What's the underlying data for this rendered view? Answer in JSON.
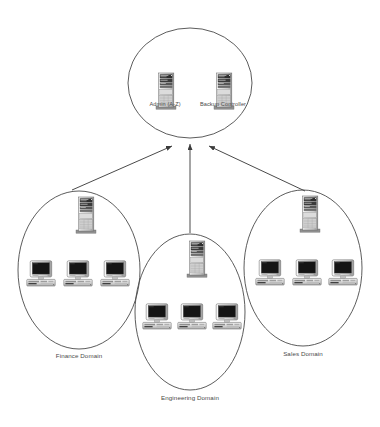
{
  "diagram": {
    "type": "network-topology",
    "background_color": "#ffffff",
    "line_color": "#4a4a4a",
    "width": 380,
    "height": 427
  },
  "root_group": {
    "name": "root-domain-circle",
    "shape": "ellipse",
    "cx": 190,
    "cy": 83,
    "rx": 62,
    "ry": 55,
    "servers": [
      {
        "label": "Admin (A-Z)",
        "x": 155,
        "y": 72,
        "label_y": 101,
        "icon": "server-tower-icon"
      },
      {
        "label": "Backup Controller",
        "x": 213,
        "y": 72,
        "label_y": 101,
        "icon": "server-tower-icon"
      }
    ]
  },
  "domains": [
    {
      "id": "finance",
      "label": "Finance Domain",
      "shape": "ellipse",
      "cx": 79,
      "cy": 270,
      "rx": 61,
      "ry": 79,
      "label_x": 79,
      "label_y": 352,
      "server": {
        "x": 75,
        "y": 196,
        "icon": "server-tower-icon"
      },
      "workstations": [
        {
          "x": 26,
          "y": 260,
          "icon": "desktop-computer-icon"
        },
        {
          "x": 63,
          "y": 260,
          "icon": "desktop-computer-icon"
        },
        {
          "x": 100,
          "y": 260,
          "icon": "desktop-computer-icon"
        }
      ],
      "arrow": {
        "x1": 72,
        "y1": 190,
        "x2": 172,
        "y2": 146
      }
    },
    {
      "id": "engineering",
      "label": "Engineering Domain",
      "shape": "ellipse",
      "cx": 190,
      "cy": 312,
      "rx": 55,
      "ry": 78,
      "label_x": 190,
      "label_y": 394,
      "server": {
        "x": 186,
        "y": 240,
        "icon": "server-tower-icon"
      },
      "workstations": [
        {
          "x": 142,
          "y": 303,
          "icon": "desktop-computer-icon"
        },
        {
          "x": 177,
          "y": 303,
          "icon": "desktop-computer-icon"
        },
        {
          "x": 212,
          "y": 303,
          "icon": "desktop-computer-icon"
        }
      ],
      "arrow": {
        "x1": 190,
        "y1": 233,
        "x2": 190,
        "y2": 144
      }
    },
    {
      "id": "sales",
      "label": "Sales Domain",
      "shape": "ellipse",
      "cx": 303,
      "cy": 268,
      "rx": 59,
      "ry": 78,
      "label_x": 303,
      "label_y": 350,
      "server": {
        "x": 299,
        "y": 195,
        "icon": "server-tower-icon"
      },
      "workstations": [
        {
          "x": 255,
          "y": 259,
          "icon": "desktop-computer-icon"
        },
        {
          "x": 292,
          "y": 259,
          "icon": "desktop-computer-icon"
        },
        {
          "x": 328,
          "y": 259,
          "icon": "desktop-computer-icon"
        }
      ],
      "arrow": {
        "x1": 305,
        "y1": 191,
        "x2": 209,
        "y2": 146
      }
    }
  ]
}
